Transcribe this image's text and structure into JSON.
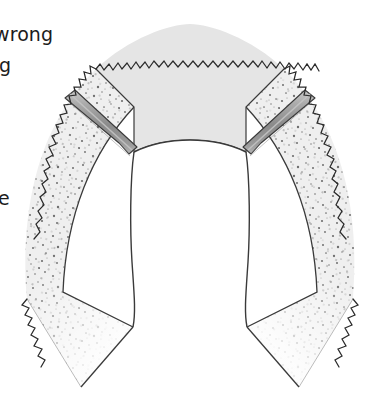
{
  "figure": {
    "labels": [
      {
        "name": "label-wrong",
        "text": "wrong"
      },
      {
        "name": "label-g",
        "text": "g"
      },
      {
        "name": "label-e",
        "text": "e"
      }
    ],
    "regions": [
      {
        "name": "upper-dome",
        "description": "light gray arched dome at top of flap",
        "fill": "#e4e4e4",
        "edge": "zigzag"
      },
      {
        "name": "left-stippled-panel",
        "description": "speckled/stippled tissue panel on lower left",
        "fill": "#ededed",
        "edge": "zigzag"
      },
      {
        "name": "right-stippled-panel",
        "description": "speckled/stippled tissue panel on lower right",
        "fill": "#ededed",
        "edge": "zigzag"
      },
      {
        "name": "left-diagonal-bar",
        "description": "diagonal gray bar separating dome from left panel",
        "fill": "#8f8f8f"
      },
      {
        "name": "right-diagonal-bar",
        "description": "diagonal gray bar separating dome from right panel",
        "fill": "#8f8f8f"
      },
      {
        "name": "central-opening",
        "description": "white rounded inner opening of the horseshoe",
        "fill": "#ffffff"
      }
    ],
    "colors": {
      "outline": "#2b2b2b",
      "dome_fill": "#e4e4e4",
      "stipple_fill": "#ededed",
      "stipple_dot": "#6b6b6b",
      "bar_fill": "#8f8f8f",
      "bar_highlight": "#c8c8c8",
      "background": "#ffffff",
      "text": "#1c1c1c"
    }
  }
}
